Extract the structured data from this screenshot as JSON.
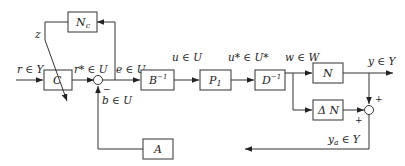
{
  "diagram": {
    "blocks": {
      "C": "C",
      "Nc": "N",
      "Nc_sub": "c",
      "Binv": "B",
      "Binv_sup": "−1",
      "P1": "P",
      "P1_sub": "1",
      "Dinv": "D",
      "Dinv_sup": "−1",
      "N": "N",
      "DeltaN": "Δ N",
      "A": "A"
    },
    "signals": {
      "r": "r ∈ Y",
      "r_star": "r* ∈ U",
      "e": "e ∈ U",
      "u": "u ∈ U",
      "u_star": "u* ∈ U*",
      "w": "w ∈ W",
      "y": "y ∈ Y",
      "y_a": "y",
      "y_a_sub": "a",
      "y_a_rest": " ∈ Y",
      "b": "b ∈ U",
      "z": "z"
    },
    "signs": {
      "sum1_minus": "−",
      "sum2_plus_top": "+",
      "sum2_plus_left": "+"
    }
  }
}
